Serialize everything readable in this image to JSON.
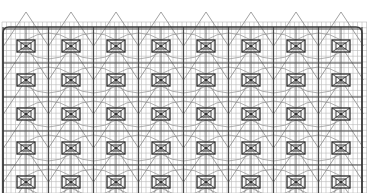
{
  "canvas": {
    "width": 369,
    "height": 193,
    "background": "#ffffff"
  },
  "drawing": {
    "type": "structural-grid-plan",
    "grid_top": 22,
    "grid_bottom": 193,
    "grid_left": 2,
    "grid_right": 367,
    "frame": {
      "x": 3,
      "y": 27,
      "right": 362,
      "radius": 6,
      "color": "#3a3a3a",
      "width": 1.6
    },
    "fine_grid": {
      "vertical_spacing": 4.5,
      "horizontal_spacing": 5.7,
      "color": "#b8b8b8",
      "width": 0.6
    },
    "main_lines": {
      "vertical_x": [
        3,
        48.5,
        93.5,
        138.5,
        183.5,
        228.5,
        273.5,
        318.5,
        362
      ],
      "horizontal_y": [
        29,
        63,
        97,
        131,
        165
      ],
      "color": "#4a4a4a",
      "width": 1.2
    },
    "modules": {
      "columns_x": [
        26,
        71,
        116,
        161,
        206,
        251,
        296,
        341
      ],
      "rows_y": [
        46,
        80,
        114,
        148,
        182
      ],
      "outer_w": 18,
      "outer_h": 12,
      "inner_w": 10,
      "inner_h": 6,
      "color": "#2e2e2e"
    },
    "diagonals": {
      "color": "#8a8a8a",
      "width": 0.8
    },
    "arcs": {
      "color": "#9a9a9a",
      "width": 0.8
    }
  }
}
